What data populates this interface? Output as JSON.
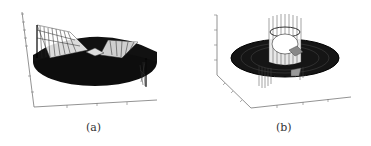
{
  "figure": {
    "panels": [
      {
        "id": "a",
        "caption": "(a)",
        "description": "3D mesh surface plot: dark annular disk with wedge-shaped raised/lowered sections"
      },
      {
        "id": "b",
        "caption": "(b)",
        "description": "3D mesh surface plot: dark annular disk with cylindrical vertical wall near center"
      }
    ]
  }
}
